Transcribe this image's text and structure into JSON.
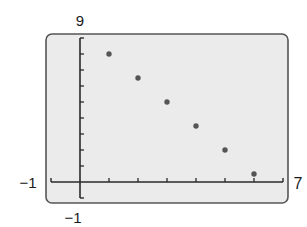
{
  "chart_data": {
    "type": "scatter",
    "title": "",
    "xlabel": "",
    "ylabel": "",
    "xlim": [
      -1,
      7
    ],
    "ylim": [
      -1,
      9
    ],
    "x_tick_step": 1,
    "y_tick_step": 1,
    "grid": false,
    "legend": null,
    "window_labels": {
      "ymax": "9",
      "xmin": "−1",
      "xmax": "7",
      "ymin": "−1"
    },
    "x": [
      1,
      2,
      3,
      4,
      5,
      6
    ],
    "y": [
      8,
      6.5,
      5,
      3.5,
      2,
      0.5
    ],
    "points": [
      {
        "x": 1,
        "y": 8
      },
      {
        "x": 2,
        "y": 6.5
      },
      {
        "x": 3,
        "y": 5
      },
      {
        "x": 4,
        "y": 3.5
      },
      {
        "x": 5,
        "y": 2
      },
      {
        "x": 6,
        "y": 0.5
      }
    ]
  },
  "style": {
    "screen_fill": "#ebebeb",
    "screen_border": "#555555",
    "axis_color": "#2a2a2a",
    "point_color": "#555555"
  }
}
